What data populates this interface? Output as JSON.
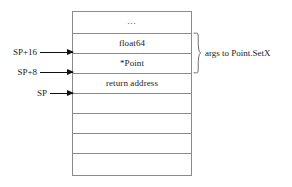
{
  "diagram": {
    "stack": {
      "cells": [
        {
          "label": "…",
          "kind": "ellipsis"
        },
        {
          "label": "float64",
          "kind": "value"
        },
        {
          "label": "*Point",
          "kind": "value"
        },
        {
          "label": "return address",
          "kind": "value"
        },
        {
          "label": "",
          "kind": "empty"
        },
        {
          "label": "",
          "kind": "empty"
        },
        {
          "label": "",
          "kind": "empty"
        },
        {
          "label": "",
          "kind": "empty"
        }
      ]
    },
    "pointers": [
      {
        "label": "SP+16"
      },
      {
        "label": "SP+8"
      },
      {
        "label": "SP"
      }
    ],
    "annotation": {
      "label": "args to Point.SetX"
    },
    "colors": {
      "box_border": "#8a8a8a",
      "arrow": "#111111",
      "text": "#1a1a1a",
      "background": "#ffffff"
    }
  }
}
